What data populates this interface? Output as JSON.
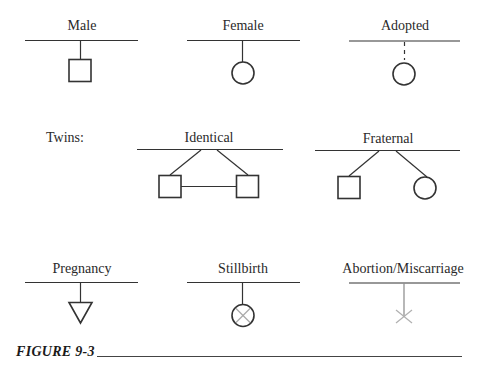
{
  "figure": {
    "caption": "FIGURE 9-3"
  },
  "row1": {
    "male": {
      "label": "Male",
      "symbol": "square"
    },
    "female": {
      "label": "Female",
      "symbol": "circle"
    },
    "adopted": {
      "label": "Adopted",
      "symbol": "circle-dashed-stem"
    }
  },
  "row2": {
    "twins_label": "Twins:",
    "identical": {
      "label": "Identical",
      "symbols": [
        "square",
        "square"
      ],
      "connected": true
    },
    "fraternal": {
      "label": "Fraternal",
      "symbols": [
        "square",
        "circle"
      ],
      "connected": false
    }
  },
  "row3": {
    "pregnancy": {
      "label": "Pregnancy",
      "symbol": "triangle-down"
    },
    "stillbirth": {
      "label": "Stillbirth",
      "symbol": "crossed-circle"
    },
    "abortion": {
      "label": "Abortion/Miscarriage",
      "symbol": "x-mark"
    }
  },
  "colors": {
    "line": "#333333",
    "faint": "#9a9a9a",
    "background": "#ffffff"
  }
}
